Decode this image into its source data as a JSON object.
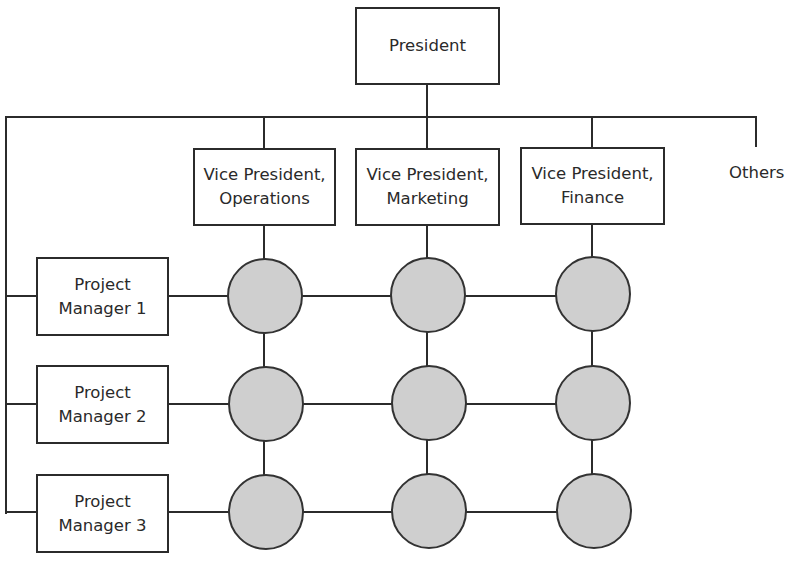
{
  "diagram": {
    "type": "matrix-organization-chart",
    "top": {
      "label": "President"
    },
    "functional_heads": [
      {
        "line1": "Vice President,",
        "line2": "Operations"
      },
      {
        "line1": "Vice President,",
        "line2": "Marketing"
      },
      {
        "line1": "Vice President,",
        "line2": "Finance"
      }
    ],
    "others_label": "Others",
    "project_managers": [
      {
        "line1": "Project",
        "line2": "Manager 1"
      },
      {
        "line1": "Project",
        "line2": "Manager 2"
      },
      {
        "line1": "Project",
        "line2": "Manager 3"
      }
    ],
    "matrix_nodes": {
      "rows": 3,
      "cols": 3,
      "fill": "#cfcfcf",
      "stroke": "#333333"
    },
    "colors": {
      "line": "#2b2b2b",
      "background": "#ffffff",
      "box_fill": "#ffffff"
    }
  }
}
